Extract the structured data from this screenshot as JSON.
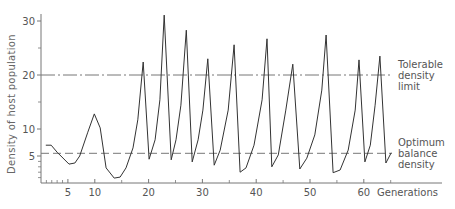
{
  "chart_data": {
    "type": "line",
    "title": "",
    "xlabel": "Generations",
    "ylabel": "Density of host population",
    "xlim": [
      0,
      70
    ],
    "ylim": [
      0,
      32
    ],
    "x_ticks": [
      5,
      10,
      20,
      30,
      40,
      50,
      60
    ],
    "x_tick_labels": [
      "5",
      "10",
      "20",
      "30",
      "40",
      "50",
      "60"
    ],
    "x_minor_ticks": [
      1,
      2,
      3,
      4,
      15,
      25,
      35,
      45,
      55,
      65
    ],
    "y_ticks": [
      5,
      10,
      20,
      30
    ],
    "y_tick_labels": [
      "5",
      "10",
      "20",
      "30"
    ],
    "y_minor_ticks": [
      1,
      2,
      3,
      4,
      15,
      25
    ],
    "grid": false,
    "series": [
      {
        "name": "Host population density",
        "x": [
          0.9,
          1.9,
          3.0,
          5.2,
          6.3,
          7.2,
          8.7,
          9.9,
          11.0,
          12.1,
          13.6,
          14.7,
          15.8,
          17.1,
          18.0,
          19.0,
          20.1,
          21.2,
          22.1,
          22.9,
          24.2,
          25.1,
          26.0,
          27.0,
          28.1,
          29.2,
          30.1,
          31.0,
          32.2,
          33.3,
          34.8,
          35.9,
          37.0,
          38.1,
          39.6,
          41.1,
          42.0,
          42.9,
          44.1,
          45.5,
          46.8,
          48.1,
          49.4,
          50.9,
          52.2,
          53.0,
          54.3,
          55.6,
          57.1,
          58.4,
          59.1,
          60.2,
          61.2,
          62.1,
          63.0,
          64.1,
          65.1
        ],
        "values": [
          7.0,
          7.0,
          5.7,
          3.5,
          3.7,
          5.0,
          9.4,
          12.8,
          10.2,
          2.8,
          0.9,
          1.1,
          2.8,
          6.5,
          11.7,
          22.4,
          4.4,
          8.0,
          15.4,
          31.1,
          4.3,
          8.0,
          14.4,
          28.3,
          3.9,
          8.0,
          13.5,
          23.0,
          3.3,
          6.1,
          13.5,
          25.6,
          2.0,
          2.8,
          7.0,
          15.4,
          26.7,
          3.0,
          5.2,
          13.5,
          22.0,
          2.6,
          4.6,
          8.9,
          17.2,
          27.4,
          1.9,
          2.4,
          6.1,
          13.5,
          22.8,
          3.9,
          7.0,
          14.4,
          23.5,
          3.7,
          5.6
        ]
      }
    ],
    "reference_lines": [
      {
        "name": "tolerable-density-limit",
        "value": 20,
        "style": "dash-dot",
        "label_lines": [
          "Tolerable",
          "density",
          "limit"
        ]
      },
      {
        "name": "optimum-balance-density",
        "value": 5.5,
        "style": "dashed",
        "label_lines": [
          "Optimum",
          "balance",
          "density"
        ]
      }
    ],
    "line_color": "#333333",
    "axis_color": "#777777"
  }
}
